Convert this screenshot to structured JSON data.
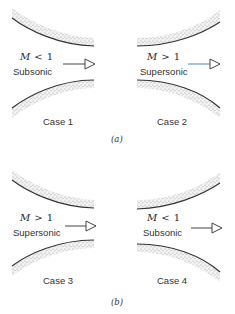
{
  "figure": {
    "panels": [
      {
        "label": "(a)",
        "cases": [
          {
            "case_label": "Case 1",
            "mach": "M",
            "operator": "<",
            "value": "1",
            "regime": "Subsonic",
            "nozzle": "converging"
          },
          {
            "case_label": "Case 2",
            "mach": "M",
            "operator": ">",
            "value": "1",
            "regime": "Supersonic",
            "nozzle": "diverging"
          }
        ]
      },
      {
        "label": "(b)",
        "cases": [
          {
            "case_label": "Case 3",
            "mach": "M",
            "operator": ">",
            "value": "1",
            "regime": "Supersonic",
            "nozzle": "converging"
          },
          {
            "case_label": "Case 4",
            "mach": "M",
            "operator": "<",
            "value": "1",
            "regime": "Subsonic",
            "nozzle": "diverging"
          }
        ]
      }
    ],
    "colors": {
      "wall_line": "#333333",
      "stipple": "#9a9a9a",
      "arrow": "#444444",
      "arrow_accent": "#4a8bb0",
      "text": "#333333"
    }
  }
}
